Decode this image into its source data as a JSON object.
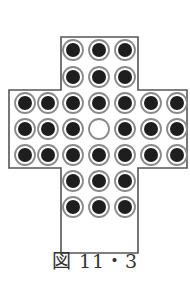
{
  "figure": {
    "caption": "図 11・3",
    "colors": {
      "outline": "#555555",
      "peg": "#1e1e1e",
      "ring": "#8a8a8a",
      "hole_fill": "#ffffff"
    }
  },
  "board": {
    "grid_size": 7,
    "column_x": [
      25,
      48,
      73,
      99,
      125,
      151,
      177
    ],
    "row_y": [
      50,
      77,
      103,
      129,
      155,
      181,
      207
    ],
    "layout": [
      "..PPP..",
      "..PPP..",
      "PPPPPPP",
      "PPPOPPP",
      "PPPPPPP",
      "..PPP..",
      "..PPP.."
    ],
    "legend": {
      "P": "peg",
      "O": "empty-hole",
      ".": "no-hole"
    },
    "peg_count": 32,
    "empty_count": 1
  }
}
